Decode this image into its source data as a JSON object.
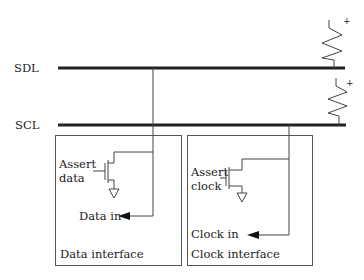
{
  "diagram": {
    "type": "i2c-bus-interface",
    "buses": [
      {
        "id": "sdl",
        "label": "SDL"
      },
      {
        "id": "scl",
        "label": "SCL"
      }
    ],
    "pullups": [
      {
        "bus": "sdl",
        "supply_label": "+"
      },
      {
        "bus": "scl",
        "supply_label": "+"
      }
    ],
    "data_interface": {
      "title": "Data interface",
      "assert_label_line1": "Assert",
      "assert_label_line2": "data",
      "input_label": "Data in"
    },
    "clock_interface": {
      "title": "Clock interface",
      "assert_label_line1": "Assert",
      "assert_label_line2": "clock",
      "input_label": "Clock in"
    },
    "colors": {
      "line": "#222222",
      "background": "#ffffff"
    }
  }
}
